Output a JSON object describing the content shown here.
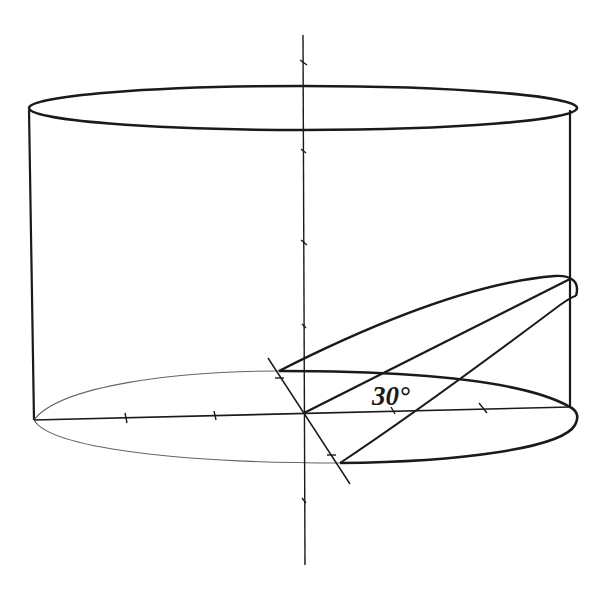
{
  "diagram": {
    "type": "geometry",
    "labels": {
      "angle": "30°"
    },
    "angle_degrees": 30,
    "elements": [
      "cylinder top ellipse",
      "cylinder side walls",
      "cylinder base ellipse (back half thin, front half bold)",
      "vertical axis through base center",
      "horizontal diameter of base",
      "diagonal diameter (intersection of cutting plane with base)",
      "inclined cutting ellipse",
      "major axis of inclined section"
    ],
    "colors": {
      "stroke": "#1a1a1a",
      "thin_stroke": "#555555",
      "background": "#ffffff"
    }
  }
}
